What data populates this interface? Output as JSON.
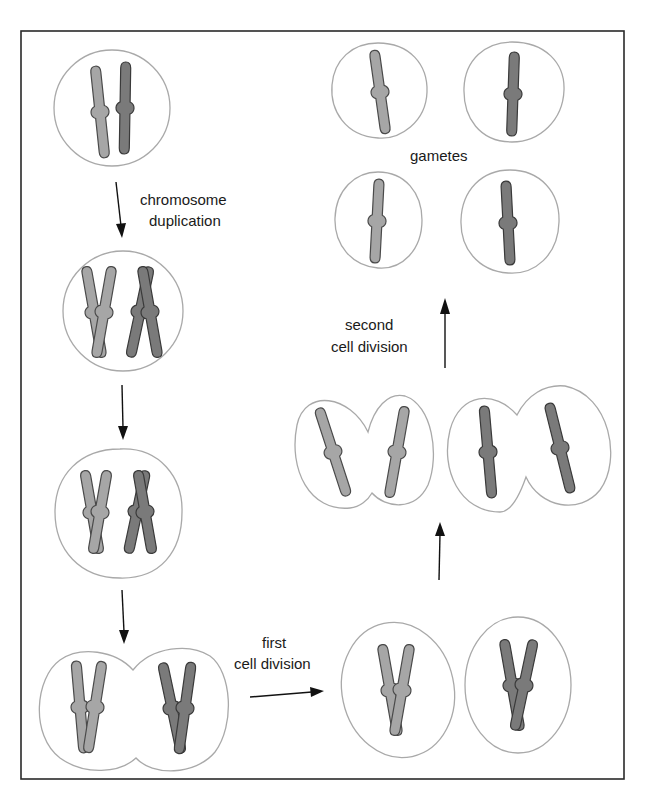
{
  "diagram": {
    "labels": {
      "chromosome_duplication": [
        "chromosome",
        "duplication"
      ],
      "first_cell_division": [
        "first",
        "cell division"
      ],
      "second_cell_division": [
        "second",
        "cell division"
      ],
      "gametes": "gametes"
    },
    "stages": [
      {
        "id": "parent-cell",
        "description": "cell with one light and one dark chromosome"
      },
      {
        "id": "duplicated",
        "description": "each chromosome duplicated into two chromatids"
      },
      {
        "id": "paired",
        "description": "homologous duplicated chromosomes"
      },
      {
        "id": "dividing",
        "description": "cell pinching into two"
      },
      {
        "id": "after-first-division",
        "description": "two cells, each with one duplicated chromosome"
      },
      {
        "id": "second-division",
        "description": "each cell dividing again"
      },
      {
        "id": "gametes",
        "description": "four gametes, each with one chromosome"
      }
    ],
    "colors": {
      "chromosome_light": "#a6a6a6",
      "chromosome_dark": "#7a7a7a",
      "cell_outline": "#a9a9a9",
      "frame": "#2a2a2a"
    }
  }
}
